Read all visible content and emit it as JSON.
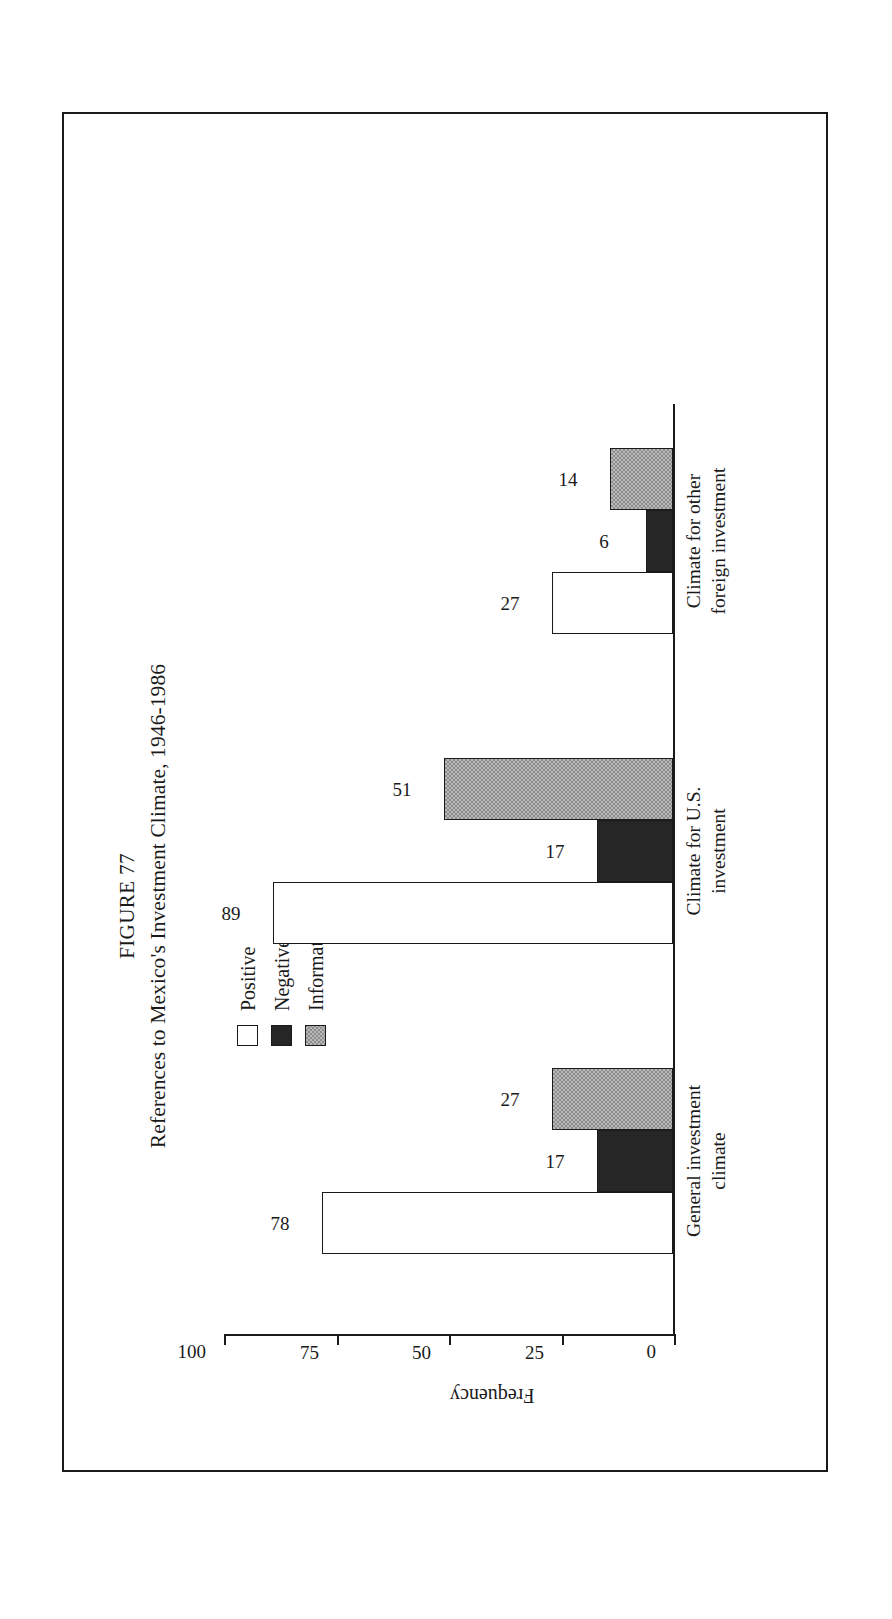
{
  "figure": {
    "number_label": "FIGURE 77",
    "caption": "References to Mexico's Investment Climate, 1946-1986"
  },
  "legend": {
    "position": "upper-right",
    "items": [
      {
        "label": "Positive",
        "swatch": "white-open-square",
        "color": "#ffffff"
      },
      {
        "label": "Negative",
        "swatch": "black-filled-square",
        "color": "#262626"
      },
      {
        "label": "Informative",
        "swatch": "gray-checkered-square",
        "color": "#b9b9b9"
      }
    ]
  },
  "chart_data": {
    "type": "bar",
    "title": "References to Mexico's Investment Climate, 1946-1986",
    "xlabel": "",
    "ylabel": "Frequency",
    "ylim": [
      0,
      100
    ],
    "yticks": [
      0,
      25,
      50,
      75,
      100
    ],
    "ytick_labels": [
      "0",
      "25",
      "50",
      "75",
      "100"
    ],
    "grid": false,
    "orientation": "vertical-bars-rotated-90ccw-on-page",
    "categories": [
      "General investment\nclimate",
      "Climate for U.S.\ninvestment",
      "Climate for other\nforeign investment"
    ],
    "series": [
      {
        "name": "Positive",
        "values": [
          78,
          89,
          27
        ]
      },
      {
        "name": "Negative",
        "values": [
          17,
          17,
          6
        ]
      },
      {
        "name": "Informative",
        "values": [
          27,
          51,
          14
        ]
      }
    ],
    "data_labels": [
      "78",
      "17",
      "27",
      "89",
      "17",
      "51",
      "27",
      "6",
      "14"
    ]
  }
}
